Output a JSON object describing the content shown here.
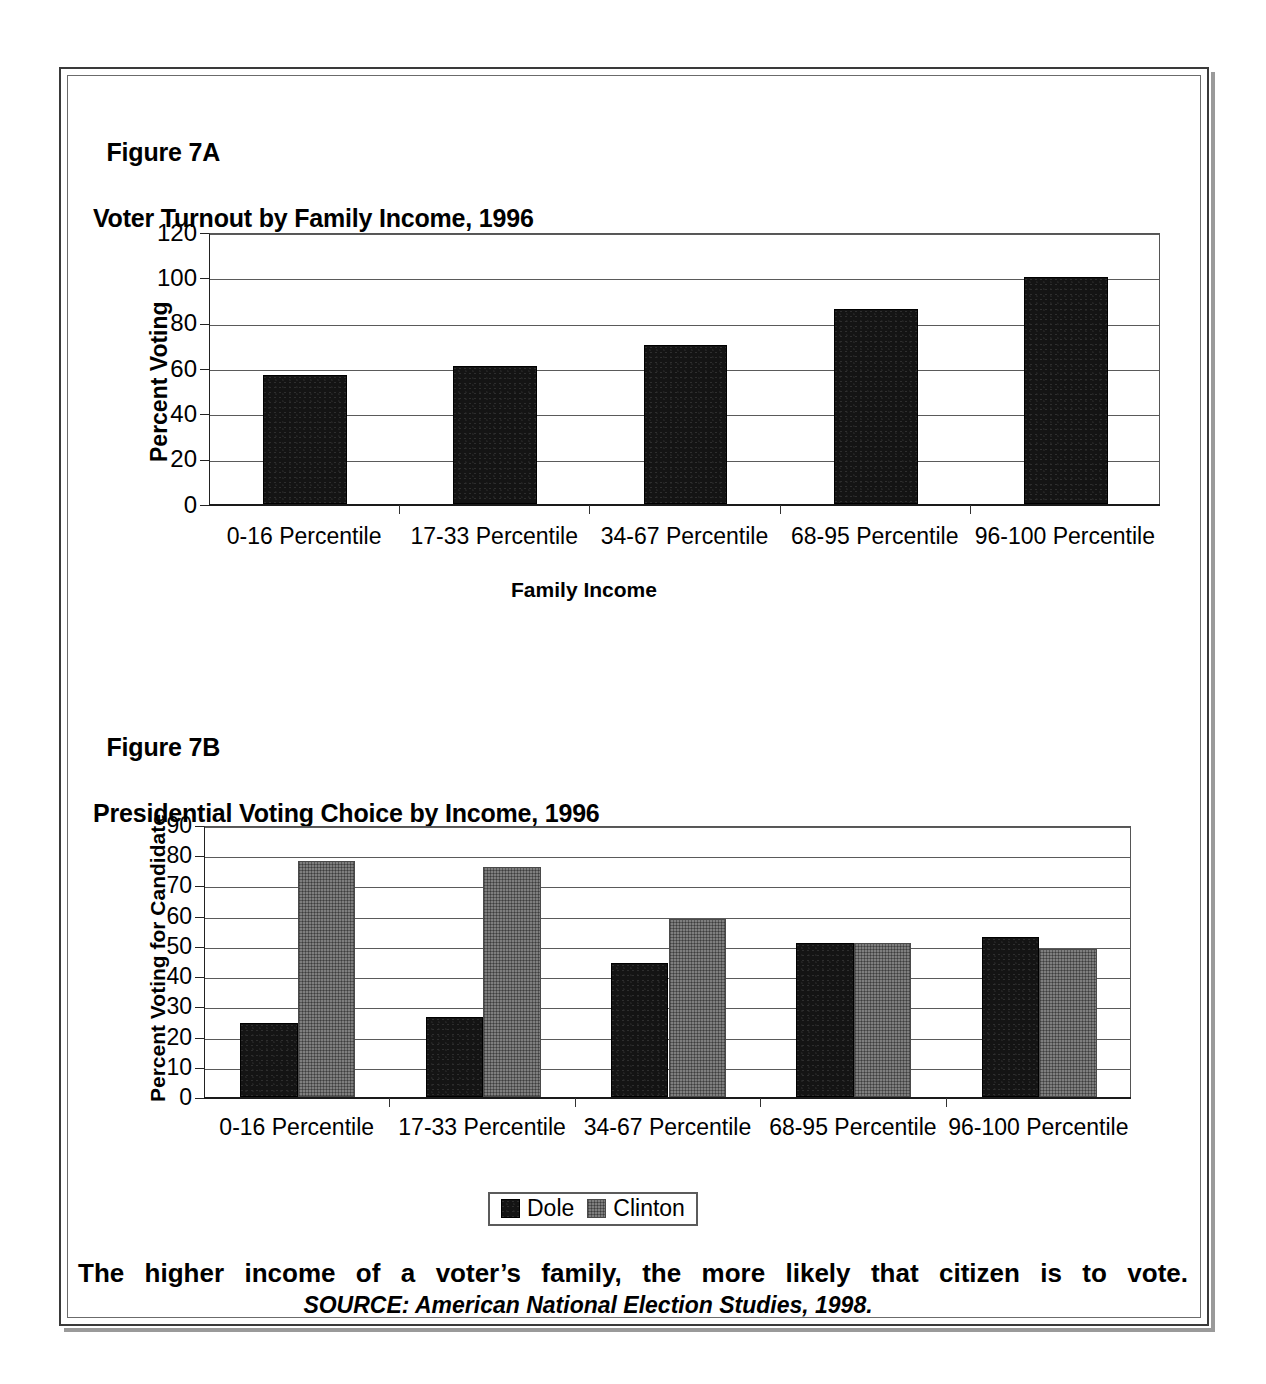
{
  "figure": {
    "frame_color": "#3a3a3a",
    "caption_main": "The higher income of a voter’s family, the more likely that citizen is to vote.",
    "caption_source": "SOURCE: American National Election Studies, 1998."
  },
  "fig7a": {
    "label": "Figure 7A",
    "title": "Voter Turnout by Family Income, 1996"
  },
  "fig7b": {
    "label": "Figure 7B",
    "title": "Presidential Voting Choice by Income, 1996"
  },
  "legend": {
    "items": [
      {
        "label": "Dole",
        "color": "#141414"
      },
      {
        "label": "Clinton",
        "color": "#7e7e7e"
      }
    ]
  },
  "chart_data": [
    {
      "type": "bar",
      "id": "figure-7a",
      "title": "Voter Turnout by Family Income, 1996",
      "figure_label": "Figure 7A",
      "categories": [
        "0-16 Percentile",
        "17-33 Percentile",
        "34-67 Percentile",
        "68-95 Percentile",
        "96-100 Percentile"
      ],
      "values": [
        57,
        61,
        70,
        86,
        100
      ],
      "series": [
        {
          "name": "Percent Voting",
          "values": [
            57,
            61,
            70,
            86,
            100
          ],
          "color": "#141414"
        }
      ],
      "xlabel": "Family Income",
      "ylabel": "Percent Voting",
      "ylim": [
        0,
        120
      ],
      "yticks": [
        0,
        20,
        40,
        60,
        80,
        100,
        120
      ],
      "ytick_labels": [
        "0",
        "20",
        "40",
        "60",
        "80",
        "100",
        "120"
      ],
      "grid": true,
      "legend": false
    },
    {
      "type": "bar",
      "id": "figure-7b",
      "title": "Presidential Voting Choice by Income, 1996",
      "figure_label": "Figure 7B",
      "categories": [
        "0-16 Percentile",
        "17-33 Percentile",
        "34-67 Percentile",
        "68-95 Percentile",
        "96-100 Percentile"
      ],
      "series": [
        {
          "name": "Dole",
          "values": [
            24.5,
            26.5,
            44.5,
            51,
            53
          ],
          "color": "#141414"
        },
        {
          "name": "Clinton",
          "values": [
            78,
            76,
            59,
            51,
            49
          ],
          "color": "#7e7e7e"
        }
      ],
      "xlabel": "",
      "ylabel": "Percent Voting for Candidate",
      "ylim": [
        0,
        90
      ],
      "yticks": [
        0,
        10,
        20,
        30,
        40,
        50,
        60,
        70,
        80,
        90
      ],
      "ytick_labels": [
        "0",
        "10",
        "20",
        "30",
        "40",
        "50",
        "60",
        "70",
        "80",
        "90"
      ],
      "grid": true,
      "legend": true,
      "legend_position": "bottom"
    }
  ]
}
